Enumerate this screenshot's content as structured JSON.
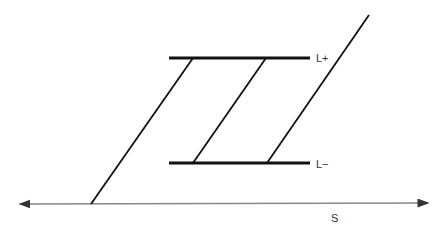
{
  "diagram": {
    "labels": {
      "upper": "L+",
      "lower": "L−",
      "axis": "S"
    },
    "colors": {
      "line": "#111111",
      "axis": "#777777",
      "text": "#333333"
    }
  }
}
